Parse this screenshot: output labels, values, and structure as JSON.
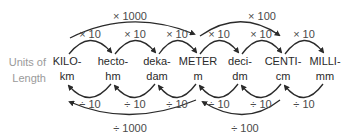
{
  "side_label": {
    "line1": "Units of",
    "line2": "Length"
  },
  "units": [
    {
      "prefix": "KILO-",
      "symbol": "km",
      "x": 67
    },
    {
      "prefix": "hecto-",
      "symbol": "hm",
      "x": 113
    },
    {
      "prefix": "deka-",
      "symbol": "dam",
      "x": 157
    },
    {
      "prefix": "METER",
      "symbol": "m",
      "x": 198
    },
    {
      "prefix": "deci-",
      "symbol": "dm",
      "x": 240
    },
    {
      "prefix": "CENTI-",
      "symbol": "cm",
      "x": 283
    },
    {
      "prefix": "MILLI-",
      "symbol": "mm",
      "x": 325
    }
  ],
  "top_small": [
    {
      "label": "× 10",
      "x": 90
    },
    {
      "label": "× 10",
      "x": 135
    },
    {
      "label": "× 10",
      "x": 177
    },
    {
      "label": "× 10",
      "x": 219
    },
    {
      "label": "× 10",
      "x": 261
    },
    {
      "label": "× 10",
      "x": 304
    }
  ],
  "top_big": [
    {
      "label": "× 1000",
      "x": 130
    },
    {
      "label": "× 100",
      "x": 262
    }
  ],
  "bottom_small": [
    {
      "label": "÷ 10",
      "x": 90
    },
    {
      "label": "÷ 10",
      "x": 135
    },
    {
      "label": "÷ 10",
      "x": 177
    },
    {
      "label": "÷ 10",
      "x": 219
    },
    {
      "label": "÷ 10",
      "x": 261
    },
    {
      "label": "÷ 10",
      "x": 304
    }
  ],
  "bottom_big": [
    {
      "label": "÷ 1000",
      "x": 130
    },
    {
      "label": "÷ 100",
      "x": 245
    }
  ],
  "colors": {
    "arrow": "#2a2a2a",
    "side_label": "#9a9a9a"
  }
}
